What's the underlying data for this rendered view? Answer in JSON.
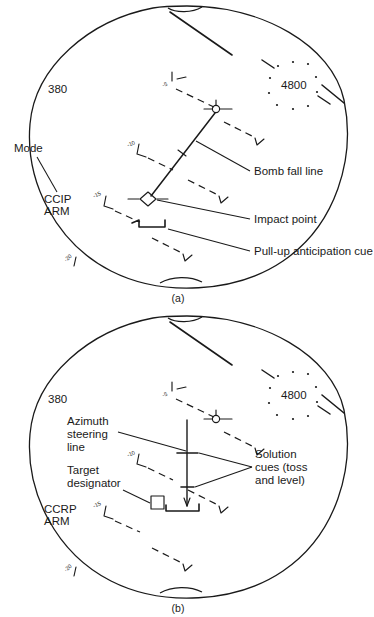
{
  "document": {
    "title": "HUD bombing mode symbology",
    "background_color": "#ffffff",
    "line_color": "#1a1a1a"
  },
  "figures": [
    {
      "id": "a",
      "caption": "(a)",
      "mode_name": "CCIP",
      "hud_readouts": {
        "airspeed": "380",
        "altitude": "4800",
        "mode_line_1": "CCIP",
        "mode_line_2": "ARM"
      },
      "pitch_ladder": [
        {
          "label": "-5"
        },
        {
          "label": "-10"
        },
        {
          "label": "-15"
        },
        {
          "label": "-20"
        }
      ],
      "callouts": [
        {
          "id": "mode",
          "text": "Mode"
        },
        {
          "id": "bomb-fall-line",
          "text": "Bomb fall line"
        },
        {
          "id": "impact-point",
          "text": "Impact point"
        },
        {
          "id": "pull-up-anticipation-cue",
          "text": "Pull-up anticipation cue"
        }
      ]
    },
    {
      "id": "b",
      "caption": "(b)",
      "mode_name": "CCRP",
      "hud_readouts": {
        "airspeed": "380",
        "altitude": "4800",
        "mode_line_1": "CCRP",
        "mode_line_2": "ARM"
      },
      "pitch_ladder": [
        {
          "label": "-5"
        },
        {
          "label": "-10"
        },
        {
          "label": "-15"
        },
        {
          "label": "-20"
        }
      ],
      "callouts": [
        {
          "id": "azimuth-steering-line",
          "line_1": "Azimuth",
          "line_2": "steering",
          "line_3": "line"
        },
        {
          "id": "target-designator",
          "line_1": "Target",
          "line_2": "designator"
        },
        {
          "id": "solution-cues",
          "line_1": "Solution",
          "line_2": "cues (toss",
          "line_3": "and level)"
        }
      ]
    }
  ]
}
